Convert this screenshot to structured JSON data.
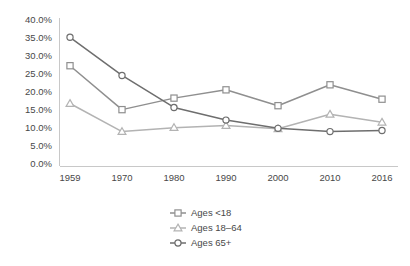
{
  "chart_data": {
    "type": "line",
    "title": "",
    "subtitle": "",
    "xlabel": "",
    "ylabel": "",
    "categories": [
      "1959",
      "1970",
      "1980",
      "1990",
      "2000",
      "2010",
      "2016"
    ],
    "ylim": [
      0,
      40
    ],
    "ytick_step": 5,
    "ytick_labels": [
      "0.0%",
      "5.0%",
      "10.0%",
      "15.0%",
      "20.0%",
      "25.0%",
      "30.0%",
      "35.0%",
      "40.0%"
    ],
    "ytick_values": [
      0,
      5,
      10,
      15,
      20,
      25,
      30,
      35,
      40
    ],
    "grid": false,
    "legend_position": "bottom-center",
    "series": [
      {
        "name": "Ages <18",
        "marker": "square",
        "color": "#8f8f8f",
        "values": [
          27.3,
          15.1,
          18.3,
          20.6,
          16.2,
          22.0,
          18.0
        ]
      },
      {
        "name": "Ages 18–64",
        "marker": "triangle",
        "color": "#b3b3b3",
        "values": [
          16.8,
          9.0,
          10.1,
          10.7,
          9.8,
          13.8,
          11.6
        ]
      },
      {
        "name": "Ages 65+",
        "marker": "circle",
        "color": "#6e6e6e",
        "values": [
          35.2,
          24.6,
          15.7,
          12.2,
          9.9,
          9.0,
          9.3
        ]
      }
    ]
  },
  "legend": {
    "items": [
      {
        "label": "Ages <18"
      },
      {
        "label": "Ages 18–64"
      },
      {
        "label": "Ages 65+"
      }
    ]
  },
  "axes": {
    "y_axis_name": "percent-axis",
    "x_axis_name": "year-axis"
  }
}
